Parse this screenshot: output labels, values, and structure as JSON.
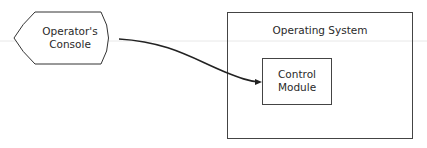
{
  "diagram": {
    "console": {
      "line1": "Operator's",
      "line2": "Console"
    },
    "os": {
      "label": "Operating System"
    },
    "module": {
      "line1": "Control",
      "line2": "Module"
    },
    "colors": {
      "stroke": "#333333",
      "guide": "#e6e6e6"
    }
  }
}
